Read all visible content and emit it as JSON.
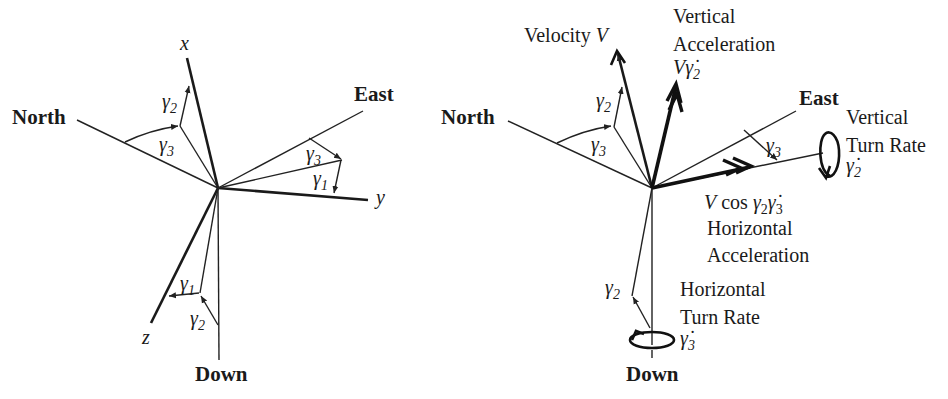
{
  "colors": {
    "ink": "#1a1a1a",
    "background": "#ffffff"
  },
  "left_diagram": {
    "axes": {
      "north": "North",
      "east": "East",
      "down": "Down",
      "x": "x",
      "y": "y",
      "z": "z"
    },
    "angles": {
      "gamma2_top": {
        "sym": "γ",
        "sub": "2"
      },
      "gamma3_left": {
        "sym": "γ",
        "sub": "3"
      },
      "gamma3_right": {
        "sym": "γ",
        "sub": "3"
      },
      "gamma1_right": {
        "sym": "γ",
        "sub": "1"
      },
      "gamma1_bottom": {
        "sym": "γ",
        "sub": "1"
      },
      "gamma2_bottom": {
        "sym": "γ",
        "sub": "2"
      }
    }
  },
  "right_diagram": {
    "axes": {
      "north": "North",
      "east": "East",
      "down": "Down"
    },
    "velocity_label": "Velocity",
    "velocity_symbol": "V",
    "vertical_accel": {
      "line1": "Vertical",
      "line2": "Acceleration",
      "sym_V": "V",
      "sym": "γ̇",
      "sub": "2"
    },
    "vertical_turn_rate": {
      "line1": "Vertical",
      "line2": "Turn Rate",
      "sym": "γ̇",
      "sub": "2"
    },
    "horizontal_accel": {
      "formula_V": "V",
      "formula_cos": "cos",
      "formula_g": "γ",
      "formula_g_sub": "2",
      "formula_gdot": "γ̇",
      "formula_gdot_sub": "3",
      "line1": "Horizontal",
      "line2": "Acceleration"
    },
    "horizontal_turn_rate": {
      "line1": "Horizontal",
      "line2": "Turn Rate",
      "sym": "γ̇",
      "sub": "3"
    },
    "angles": {
      "gamma2_top": {
        "sym": "γ",
        "sub": "2"
      },
      "gamma3_left": {
        "sym": "γ",
        "sub": "3"
      },
      "gamma3_right": {
        "sym": "γ",
        "sub": "3"
      },
      "gamma2_bottom": {
        "sym": "γ",
        "sub": "2"
      }
    }
  }
}
